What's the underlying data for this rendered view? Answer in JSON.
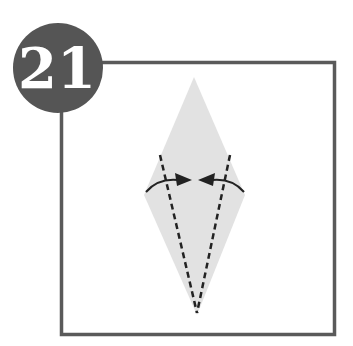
{
  "step": {
    "number": "21"
  },
  "diagram": {
    "type": "origami-fold-step",
    "shape": "kite-diamond",
    "colors": {
      "badge": "#555555",
      "badge_text": "#ffffff",
      "frame": "#5a5a5a",
      "paper": "#e2e2e2",
      "lines": "#222222"
    },
    "folds": [
      {
        "type": "valley-fold",
        "side": "left",
        "direction": "toward-center"
      },
      {
        "type": "valley-fold",
        "side": "right",
        "direction": "toward-center"
      }
    ]
  }
}
